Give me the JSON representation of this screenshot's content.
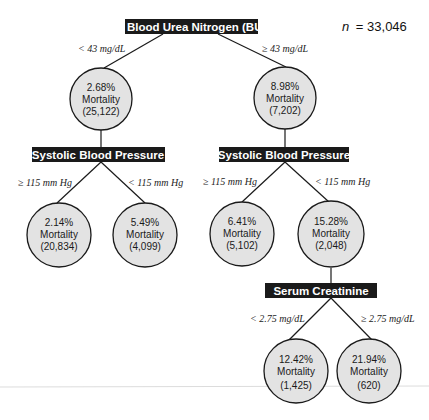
{
  "sample_size": {
    "prefix": "n",
    "value": "= 33,046"
  },
  "root": {
    "label": "Blood Urea Nitrogen (BUN"
  },
  "splits": {
    "left_condition": "< 43 mg/dL",
    "right_condition": "≥ 43 mg/dL"
  },
  "level1": {
    "left": {
      "pct": "2.68%",
      "label": "Mortality",
      "count": "(25,122)"
    },
    "right": {
      "pct": "8.98%",
      "label": "Mortality",
      "count": "(7,202)"
    }
  },
  "sbp_left": {
    "label": "Systolic Blood Pressure",
    "left_condition": "≥ 115 mm Hg",
    "right_condition": "< 115 mm Hg",
    "left_node": {
      "pct": "2.14%",
      "label": "Mortality",
      "count": "(20,834)"
    },
    "right_node": {
      "pct": "5.49%",
      "label": "Mortality",
      "count": "(4,099)"
    }
  },
  "sbp_right": {
    "label": "Systolic Blood Pressure",
    "left_condition": "≥ 115 mm Hg",
    "right_condition": "< 115 mm Hg",
    "left_node": {
      "pct": "6.41%",
      "label": "Mortality",
      "count": "(5,102)"
    },
    "right_node": {
      "pct": "15.28%",
      "label": "Mortality",
      "count": "(2,048)"
    }
  },
  "creatinine": {
    "label": "Serum Creatinine",
    "left_condition": "< 2.75 mg/dL",
    "right_condition": "≥ 2.75 mg/dL",
    "left_node": {
      "pct": "12.42%",
      "label": "Mortality",
      "count": "(1,425)"
    },
    "right_node": {
      "pct": "21.94%",
      "label": "Mortality",
      "count": "(620)"
    }
  },
  "colors": {
    "box_fill": "#1a1a1a",
    "node_fill": "#e3e3e3",
    "text_dark": "#1a1a1a"
  }
}
